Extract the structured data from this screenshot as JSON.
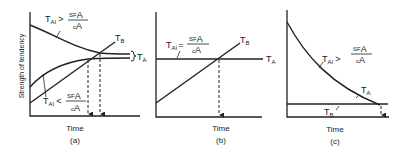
{
  "figure": {
    "ylabel": "Strength of tendency",
    "panels": [
      {
        "id": "a",
        "xlabel": "Time",
        "caption": "(a)",
        "labels": {
          "upper_T": "T",
          "upper_sub": "AI",
          "upper_rel": ">",
          "upper_num": "SF",
          "upper_num_sub": "A",
          "upper_den": "c",
          "upper_den_sub": "A",
          "lower_T": "T",
          "lower_sub": "AI",
          "lower_rel": "<",
          "lower_num": "SF",
          "lower_num_sub": "A",
          "lower_den": "c",
          "lower_den_sub": "A",
          "tb": "T",
          "tb_sub": "B",
          "ta": "T",
          "ta_sub": "A"
        }
      },
      {
        "id": "b",
        "xlabel": "Time",
        "caption": "(b)",
        "labels": {
          "eq_T": "T",
          "eq_sub": "AI",
          "eq_rel": "=",
          "eq_num": "SF",
          "eq_num_sub": "A",
          "eq_den": "c",
          "eq_den_sub": "A",
          "tb": "T",
          "tb_sub": "B",
          "ta": "T",
          "ta_sub": "A"
        }
      },
      {
        "id": "c",
        "xlabel": "Time",
        "caption": "(c)",
        "labels": {
          "gt_T": "T",
          "gt_sub": "AI",
          "gt_rel": ">",
          "gt_num": "SF",
          "gt_num_sub": "A",
          "gt_den": "c",
          "gt_den_sub": "A",
          "ta": "T",
          "ta_sub": "A",
          "tb": "T",
          "tb_sub": "B"
        }
      }
    ]
  }
}
